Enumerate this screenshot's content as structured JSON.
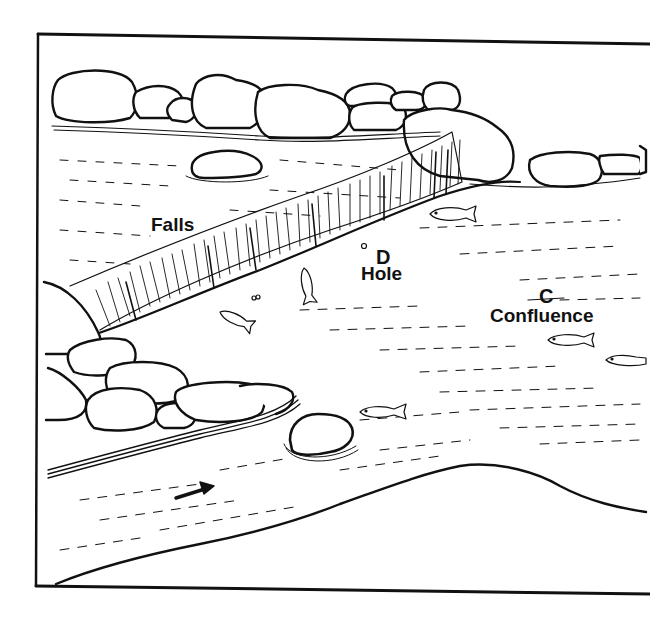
{
  "diagram": {
    "type": "river-illustration",
    "style": "black-and-white line art",
    "colors": {
      "ink": "#111111",
      "background": "#ffffff"
    },
    "labels": {
      "falls": "Falls",
      "hole_marker": "D",
      "hole": "Hole",
      "confluence_marker": "C",
      "confluence": "Confluence"
    },
    "features": [
      {
        "id": "falls",
        "label": "Falls"
      },
      {
        "id": "hole",
        "marker": "D",
        "label": "Hole"
      },
      {
        "id": "confluence",
        "marker": "C",
        "label": "Confluence"
      },
      {
        "id": "flow-arrow",
        "icon": "arrow-right-icon",
        "meaning": "direction of current"
      }
    ],
    "fish_count": 7
  }
}
